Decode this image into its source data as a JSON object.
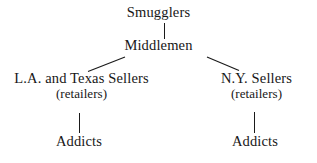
{
  "diagram": {
    "type": "hierarchy-flow-chart",
    "orientation": "top-down",
    "background_color": "#ffffff",
    "line_color": "#1a1a1a",
    "text_color": "#171717",
    "nodes": {
      "smugglers": {
        "label": "Smugglers"
      },
      "middlemen": {
        "label": "Middlemen"
      },
      "la_texas_sellers": {
        "label": "L.A. and Texas Sellers",
        "sublabel": "(retailers)"
      },
      "ny_sellers": {
        "label": "N.Y. Sellers",
        "sublabel": "(retailers)"
      },
      "addicts_left": {
        "label": "Addicts"
      },
      "addicts_right": {
        "label": "Addicts"
      }
    },
    "edges": [
      {
        "from": "smugglers",
        "to": "middlemen",
        "style": "vertical"
      },
      {
        "from": "middlemen",
        "to": "la_texas_sellers",
        "style": "diagonal-left"
      },
      {
        "from": "middlemen",
        "to": "ny_sellers",
        "style": "diagonal-right"
      },
      {
        "from": "la_texas_sellers",
        "to": "addicts_left",
        "style": "vertical"
      },
      {
        "from": "ny_sellers",
        "to": "addicts_right",
        "style": "vertical"
      }
    ]
  }
}
